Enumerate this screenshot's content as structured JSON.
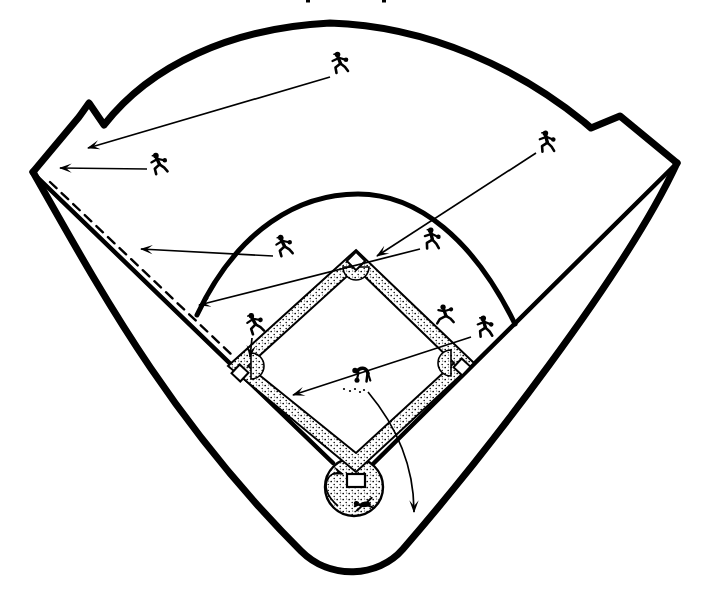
{
  "page": {
    "background": "#ffffff",
    "ink": "#000000"
  },
  "diagram": {
    "name": "baseball-field-defensive-coverage-diagram",
    "description_semantic": "double-to-left-field-corner-coverage",
    "field": {
      "shapes": [
        {
          "name": "stands-outer-boundary",
          "type": "path",
          "w": 7,
          "d": "M 33 172 C 100 290 170 420 301 551 C 330 580 378 578 403 549 C 480 460 625 275 677 163"
        },
        {
          "name": "outfield-wall",
          "type": "path",
          "w": 7,
          "d": "M 33 172 L 79 117 L 89 103 L 104 125 C 150 66 230 28 330 23 C 430 26 520 70 584 122 L 591 128 L 620 116 L 677 163"
        },
        {
          "name": "left-foul-line",
          "type": "line",
          "x1": 36,
          "y1": 176,
          "x2": 333,
          "y2": 463,
          "w": 4.5
        },
        {
          "name": "right-foul-line",
          "type": "line",
          "x1": 673,
          "y1": 167,
          "x2": 374,
          "y2": 463,
          "w": 4.5
        },
        {
          "name": "ball-path-dashed-line",
          "type": "line",
          "x1": 50,
          "y1": 182,
          "x2": 232,
          "y2": 355,
          "w": 2.4,
          "dash": "9 7"
        },
        {
          "name": "infield-grass-arc",
          "type": "path",
          "w": 5,
          "d": "M 197 315 C 238 228 300 194 358 194 C 418 194 474 240 515 324"
        }
      ]
    },
    "diamond": {
      "outer_path": "M 356 250 L 474 363 L 356 472 L 228 366 Z",
      "inner_path": "M 356 268 L 454 363 L 356 453 L 248 366 Z",
      "home_circle": {
        "cx": 354,
        "cy": 487,
        "r": 29
      },
      "cutouts": [
        {
          "name": "second-base-dirt-cutout",
          "d": "M 343 267 A 13 13 0 0 0 369 267 Z"
        },
        {
          "name": "third-base-dirt-cutout",
          "d": "M 251 353 A 13 13 0 0 1 251 379 Z"
        },
        {
          "name": "first-base-dirt-cutout",
          "d": "M 451 350 A 13 13 0 0 0 451 376 Z"
        }
      ],
      "bases": [
        {
          "name": "second-base",
          "cx": 356,
          "cy": 261,
          "size": 13,
          "rot": 45
        },
        {
          "name": "third-base",
          "cx": 240,
          "cy": 373,
          "size": 12,
          "rot": 43
        },
        {
          "name": "first-base",
          "cx": 462,
          "cy": 367,
          "size": 12,
          "rot": 43
        }
      ],
      "home_plate": {
        "x": 347,
        "y": 474,
        "w": 18,
        "h": 13
      }
    },
    "players": [
      {
        "id": "center-fielder",
        "x": 339,
        "y": 63,
        "pose": "run",
        "rot": 0
      },
      {
        "id": "left-fielder",
        "x": 158,
        "y": 164,
        "pose": "run",
        "rot": -4
      },
      {
        "id": "right-fielder",
        "x": 546,
        "y": 142,
        "pose": "run",
        "rot": 6
      },
      {
        "id": "shortstop",
        "x": 283,
        "y": 246,
        "pose": "run",
        "rot": -5
      },
      {
        "id": "second-baseman",
        "x": 431,
        "y": 239,
        "pose": "run",
        "rot": 8
      },
      {
        "id": "third-baseman",
        "x": 254,
        "y": 324,
        "pose": "run",
        "rot": -8
      },
      {
        "id": "first-baseman",
        "x": 484,
        "y": 327,
        "pose": "run",
        "rot": 5
      },
      {
        "id": "batter-runner",
        "x": 445,
        "y": 316,
        "pose": "leap",
        "rot": -6
      },
      {
        "id": "pitcher",
        "x": 362,
        "y": 374,
        "pose": "bent",
        "rot": 0
      },
      {
        "id": "catcher",
        "x": 364,
        "y": 504,
        "pose": "crouch",
        "rot": -8
      }
    ],
    "arrows": [
      {
        "name": "arrow-left-fielder-to-corner",
        "x1": 147,
        "y1": 169,
        "x2": 60,
        "y2": 168
      },
      {
        "name": "arrow-center-fielder-to-corner",
        "x1": 330,
        "y1": 77,
        "x2": 88,
        "y2": 148
      },
      {
        "name": "arrow-shortstop-to-foul-line",
        "x1": 273,
        "y1": 256,
        "x2": 141,
        "y2": 249
      },
      {
        "name": "arrow-second-baseman-to-foul-line",
        "x1": 420,
        "y1": 249,
        "x2": 199,
        "y2": 305
      },
      {
        "name": "arrow-right-fielder-to-second-base",
        "x1": 536,
        "y1": 153,
        "x2": 377,
        "y2": 256
      },
      {
        "name": "arrow-first-baseman-to-cutoff-position",
        "x1": 471,
        "y1": 337,
        "x2": 293,
        "y2": 395
      },
      {
        "name": "arrow-third-baseman-to-third-base",
        "x1": 252,
        "y1": 338,
        "x2": 250,
        "y2": 357
      },
      {
        "name": "arrow-pitcher-backs-up-home",
        "d": "M 368 392 Q 414 447 414 512"
      },
      {
        "name": "arrow-catcher-covers-home",
        "d": "M 338 506 Q 320 490 329 477 Q 334 471 343 474"
      }
    ],
    "marks": {
      "dirt-scuff-dots": [
        [
          344,
          389
        ],
        [
          350,
          391
        ],
        [
          355,
          389
        ],
        [
          360,
          392
        ],
        [
          364,
          390
        ]
      ],
      "print-artifacts": [
        [
          306,
          0
        ],
        [
          382,
          0
        ]
      ]
    }
  }
}
